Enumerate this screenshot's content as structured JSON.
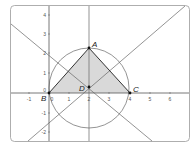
{
  "figure": {
    "x_ticks": [
      "-1",
      "0",
      "1",
      "2",
      "3",
      "4",
      "5",
      "6"
    ],
    "y_ticks": [
      "4",
      "3",
      "2",
      "1",
      "0",
      "-1",
      "-2"
    ],
    "points": {
      "A": {
        "label": "A",
        "x": 2,
        "y": 2.3
      },
      "B": {
        "label": "B",
        "x": 0,
        "y": 0
      },
      "C": {
        "label": "C",
        "x": 4,
        "y": 0
      },
      "D": {
        "label": "D",
        "x": 2,
        "y": 0.3
      }
    },
    "origin_label": "0",
    "colors": {
      "triangle_fill": "#d9d9d9",
      "lines": "#555555",
      "frame": "#888888"
    }
  }
}
